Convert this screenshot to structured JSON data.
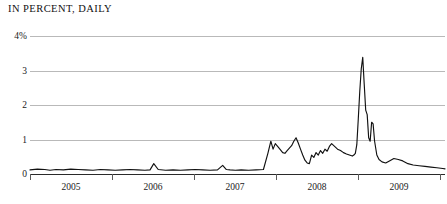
{
  "chart_title": "IN PERCENT, DAILY",
  "axes": {
    "y_ticks": [
      "4%",
      "3",
      "2",
      "1",
      "0"
    ],
    "x_ticks": [
      "2005",
      "2006",
      "2007",
      "2008",
      "2009"
    ]
  },
  "chart_data": {
    "type": "line",
    "title": "IN PERCENT, DAILY",
    "xlabel": "",
    "ylabel": "Percent",
    "ylim": [
      0,
      4
    ],
    "xlim": [
      2004.35,
      2009.95
    ],
    "grid": true,
    "legend": false,
    "line_color": "#111111",
    "series": [
      {
        "name": "Rate (percent, daily)",
        "x": [
          2004.35,
          2004.45,
          2004.55,
          2004.62,
          2004.7,
          2004.8,
          2004.9,
          2005.0,
          2005.1,
          2005.2,
          2005.3,
          2005.4,
          2005.5,
          2005.6,
          2005.7,
          2005.8,
          2005.9,
          2005.97,
          2006.02,
          2006.08,
          2006.18,
          2006.28,
          2006.38,
          2006.48,
          2006.58,
          2006.68,
          2006.78,
          2006.88,
          2006.95,
          2007.0,
          2007.05,
          2007.12,
          2007.2,
          2007.3,
          2007.4,
          2007.5,
          2007.56,
          2007.6,
          2007.63,
          2007.66,
          2007.7,
          2007.73,
          2007.76,
          2007.79,
          2007.82,
          2007.85,
          2007.88,
          2007.91,
          2007.94,
          2007.97,
          2008.0,
          2008.03,
          2008.06,
          2008.09,
          2008.12,
          2008.15,
          2008.18,
          2008.21,
          2008.24,
          2008.27,
          2008.3,
          2008.33,
          2008.36,
          2008.39,
          2008.42,
          2008.46,
          2008.5,
          2008.54,
          2008.58,
          2008.62,
          2008.66,
          2008.7,
          2008.72,
          2008.74,
          2008.76,
          2008.78,
          2008.8,
          2008.82,
          2008.84,
          2008.86,
          2008.88,
          2008.9,
          2008.92,
          2008.94,
          2008.96,
          2008.98,
          2009.0,
          2009.03,
          2009.06,
          2009.1,
          2009.15,
          2009.2,
          2009.26,
          2009.32,
          2009.38,
          2009.45,
          2009.52,
          2009.6,
          2009.68,
          2009.76,
          2009.84,
          2009.92,
          2009.95
        ],
        "y": [
          0.12,
          0.14,
          0.13,
          0.11,
          0.13,
          0.12,
          0.14,
          0.13,
          0.12,
          0.11,
          0.13,
          0.12,
          0.11,
          0.12,
          0.13,
          0.12,
          0.11,
          0.12,
          0.3,
          0.13,
          0.11,
          0.12,
          0.11,
          0.12,
          0.13,
          0.12,
          0.11,
          0.12,
          0.25,
          0.13,
          0.12,
          0.11,
          0.12,
          0.11,
          0.12,
          0.13,
          0.6,
          0.95,
          0.72,
          0.88,
          0.78,
          0.7,
          0.62,
          0.6,
          0.68,
          0.75,
          0.82,
          0.95,
          1.05,
          0.9,
          0.72,
          0.55,
          0.4,
          0.32,
          0.3,
          0.55,
          0.48,
          0.62,
          0.55,
          0.68,
          0.6,
          0.72,
          0.66,
          0.8,
          0.88,
          0.8,
          0.72,
          0.68,
          0.62,
          0.58,
          0.55,
          0.52,
          0.55,
          0.6,
          0.85,
          1.6,
          2.4,
          3.05,
          3.38,
          2.6,
          1.85,
          1.72,
          1.05,
          0.95,
          1.5,
          1.45,
          0.95,
          0.55,
          0.42,
          0.35,
          0.32,
          0.38,
          0.45,
          0.42,
          0.38,
          0.3,
          0.26,
          0.24,
          0.22,
          0.2,
          0.18,
          0.16,
          0.15
        ]
      }
    ]
  }
}
